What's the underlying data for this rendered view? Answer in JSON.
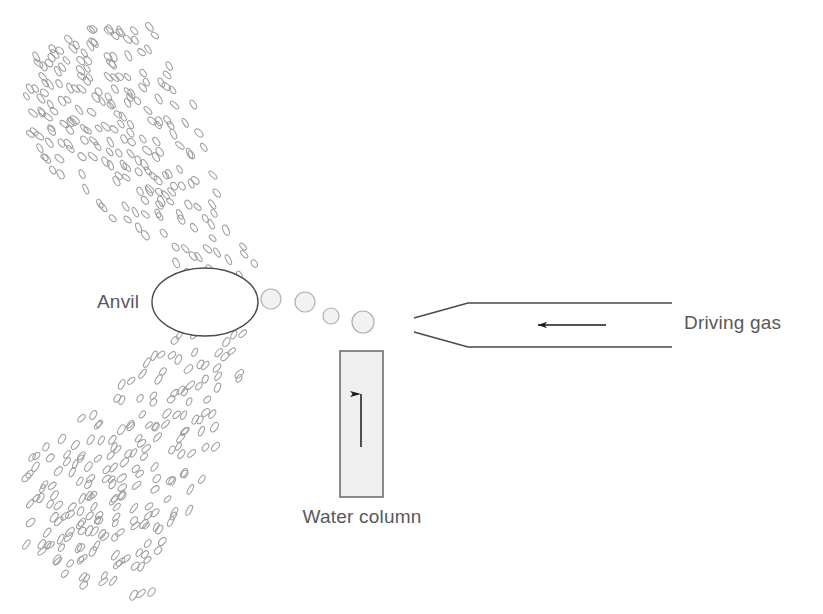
{
  "figure": {
    "type": "schematic-diagram",
    "title": "",
    "background_color": "#ffffff",
    "width": 823,
    "height": 614,
    "labels": {
      "anvil": "Anvil",
      "water_column": "Water column",
      "driving_gas": "Driving gas"
    },
    "colors": {
      "label_text": "#58585a",
      "outline": "#4a4a4a",
      "spray_outline": "#9a9aa0",
      "droplet_fill": "#f2f2f2",
      "droplet_outline": "#b0b0b4",
      "column_fill": "#efefef",
      "column_outline": "#6e6e70",
      "arrow": "#1a1a1a"
    },
    "components": [
      {
        "name": "anvil",
        "shape": "ellipse",
        "cx": 205,
        "cy": 302,
        "rx": 53,
        "ry": 34,
        "fill": "none"
      },
      {
        "name": "water-column",
        "shape": "rectangle",
        "x": 340,
        "y": 351,
        "width": 43,
        "height": 146,
        "fill": "#efefef"
      },
      {
        "name": "water-column-arrow",
        "shape": "arrow",
        "direction": "up",
        "x": 361,
        "y_start": 447,
        "y_end": 394
      },
      {
        "name": "driving-gas-nozzle",
        "shape": "tapered-tube",
        "tip_x": 414,
        "tip_top_y": 318,
        "tip_bottom_y": 332,
        "shoulder_x": 468,
        "end_x": 672,
        "top_y": 303,
        "bottom_y": 347
      },
      {
        "name": "driving-gas-arrow",
        "shape": "arrow",
        "direction": "left",
        "x_start": 606,
        "x_end": 538,
        "y": 325
      },
      {
        "name": "droplet-chain",
        "shape": "circles",
        "count": 4,
        "circles": [
          {
            "cx": 271,
            "cy": 299,
            "r": 10
          },
          {
            "cx": 305,
            "cy": 302,
            "r": 10
          },
          {
            "cx": 331,
            "cy": 316,
            "r": 8
          },
          {
            "cx": 363,
            "cy": 322,
            "r": 11
          }
        ]
      },
      {
        "name": "spray-plume-upper",
        "shape": "ellipse-cloud",
        "description": "fan of small tilted ellipses deflected upward-left from the anvil"
      },
      {
        "name": "spray-plume-lower",
        "shape": "ellipse-cloud",
        "description": "fan of small tilted ellipses deflected downward-left from the anvil"
      }
    ],
    "label_positions": {
      "anvil": {
        "x": 97,
        "y": 308,
        "anchor": "start"
      },
      "water_column": {
        "x": 362,
        "y": 523,
        "anchor": "middle"
      },
      "driving_gas": {
        "x": 684,
        "y": 329,
        "anchor": "start"
      }
    }
  }
}
